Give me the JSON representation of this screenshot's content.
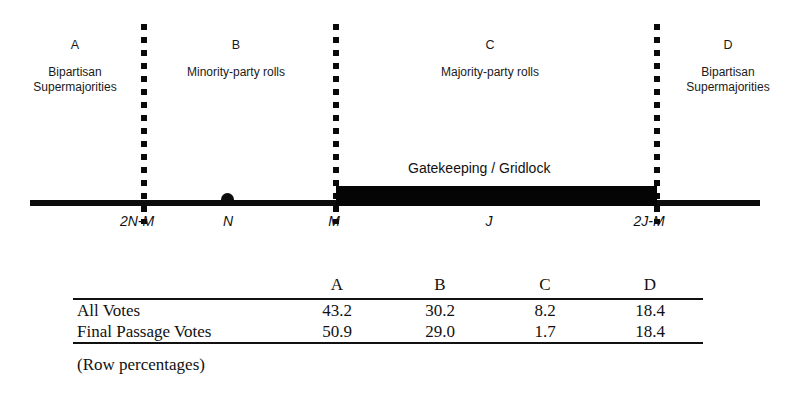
{
  "diagram": {
    "regions": [
      {
        "letter": "A",
        "description": [
          "Bipartisan",
          "Supermajorities"
        ]
      },
      {
        "letter": "B",
        "description": [
          "Minority-party rolls"
        ]
      },
      {
        "letter": "C",
        "description": [
          "Majority-party rolls"
        ]
      },
      {
        "letter": "D",
        "description": [
          "Bipartisan",
          "Supermajorities"
        ]
      }
    ],
    "gatekeeping_label": "Gatekeeping / Gridlock",
    "axis_points": [
      {
        "label": "2N-M"
      },
      {
        "label": "N"
      },
      {
        "label": "M"
      },
      {
        "label": "J"
      },
      {
        "label": "2J-M"
      }
    ]
  },
  "table": {
    "columns": [
      "A",
      "B",
      "C",
      "D"
    ],
    "rows": [
      {
        "label": "All Votes",
        "values": [
          "43.2",
          "30.2",
          "8.2",
          "18.4"
        ]
      },
      {
        "label": "Final Passage Votes",
        "values": [
          "50.9",
          "29.0",
          "1.7",
          "18.4"
        ]
      }
    ],
    "note": "(Row percentages)"
  }
}
